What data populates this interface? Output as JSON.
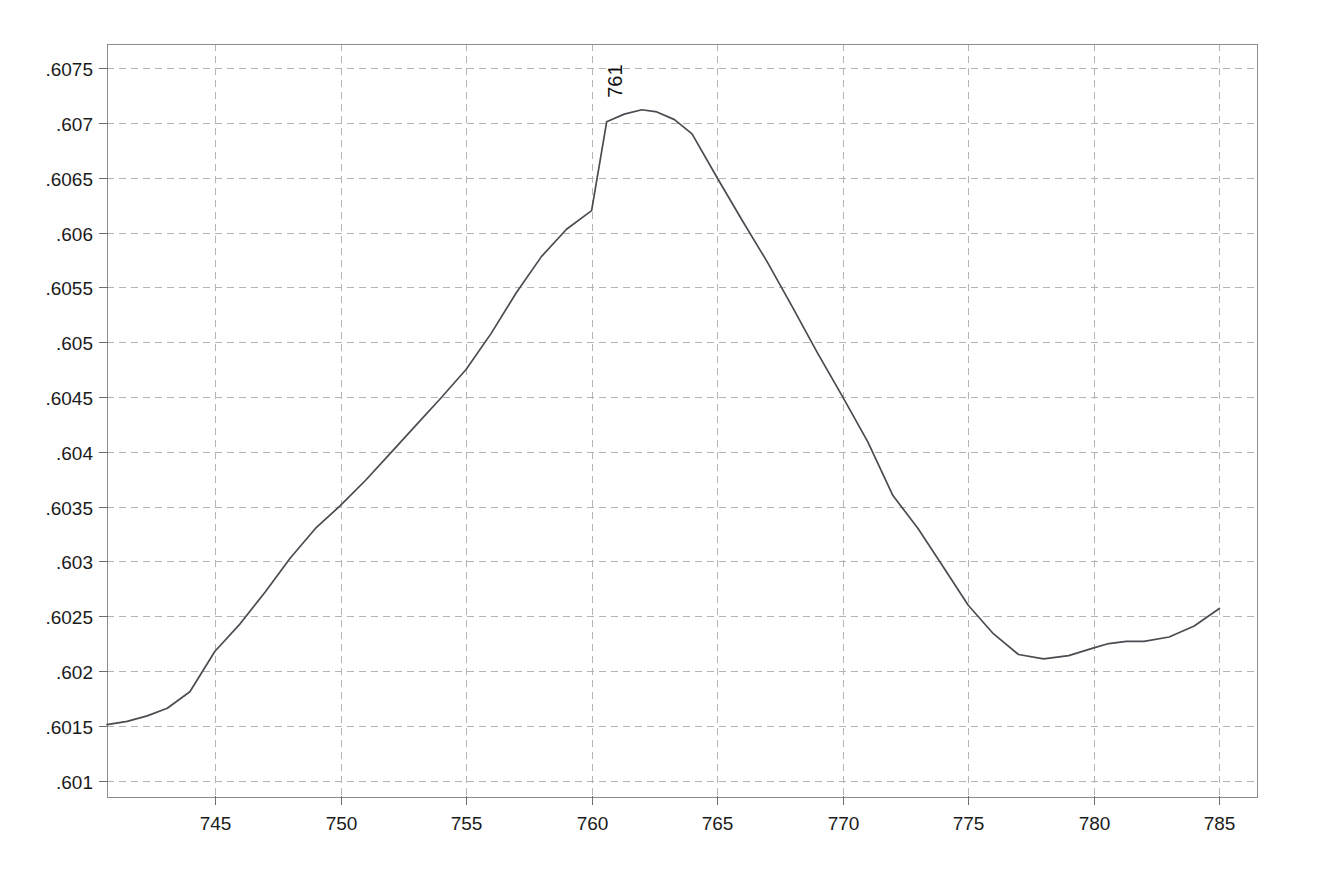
{
  "chart_data": {
    "type": "line",
    "title": "",
    "subtitle": "",
    "xlabel": "",
    "ylabel": "",
    "xlim": [
      740.7,
      786.5
    ],
    "ylim": [
      0.60085,
      0.60772
    ],
    "grid": true,
    "legend": null,
    "legend_position": "none",
    "x_ticks": [
      745,
      750,
      755,
      760,
      765,
      770,
      775,
      780,
      785
    ],
    "x_tick_labels": [
      "745",
      "750",
      "755",
      "760",
      "765",
      "770",
      "775",
      "780",
      "785"
    ],
    "y_ticks": [
      0.6075,
      0.607,
      0.6065,
      0.606,
      0.6055,
      0.605,
      0.6045,
      0.604,
      0.6035,
      0.603,
      0.6025,
      0.602,
      0.6015,
      0.601
    ],
    "y_tick_labels": [
      ".6075",
      ".607",
      ".6065",
      ".606",
      ".6055",
      ".605",
      ".6045",
      ".604",
      ".6035",
      ".603",
      ".6025",
      ".602",
      ".6015",
      ".601"
    ],
    "annotations": [
      {
        "text": "761",
        "x": 761,
        "y": 0.60712,
        "rotation": -90,
        "name": "peak-label-761"
      }
    ],
    "series": [
      {
        "name": "curve",
        "color": "#4b4b52",
        "x": [
          740.7,
          741.5,
          742.3,
          743.1,
          744.0,
          745.0,
          746.0,
          747.0,
          748.0,
          749.0,
          750.0,
          751.0,
          752.0,
          753.0,
          754.0,
          755.0,
          756.0,
          757.0,
          758.0,
          759.0,
          760.0,
          760.6,
          761.3,
          762.0,
          762.6,
          763.3,
          764.0,
          765.0,
          766.0,
          767.0,
          768.0,
          769.0,
          770.0,
          771.0,
          772.0,
          773.0,
          774.0,
          775.0,
          776.0,
          777.0,
          778.0,
          779.0,
          780.0,
          780.6,
          781.3,
          782.0,
          783.0,
          784.0,
          785.0
        ],
        "y": [
          0.60151,
          0.60154,
          0.60159,
          0.60166,
          0.60181,
          0.60218,
          0.60243,
          0.60272,
          0.60303,
          0.6033,
          0.60351,
          0.60374,
          0.60399,
          0.60424,
          0.60449,
          0.60475,
          0.60508,
          0.60545,
          0.60578,
          0.60603,
          0.6062,
          0.60701,
          0.60708,
          0.60712,
          0.6071,
          0.60703,
          0.6069,
          0.6065,
          0.60611,
          0.60573,
          0.60532,
          0.6049,
          0.6045,
          0.60409,
          0.6036,
          0.6033,
          0.60295,
          0.6026,
          0.60234,
          0.60215,
          0.60211,
          0.60214,
          0.60221,
          0.60225,
          0.60227,
          0.60227,
          0.60231,
          0.60241,
          0.60257
        ]
      }
    ]
  },
  "plot_geometry": {
    "frame_left": 107,
    "frame_right": 1257,
    "frame_top": 44,
    "frame_bottom": 797
  }
}
